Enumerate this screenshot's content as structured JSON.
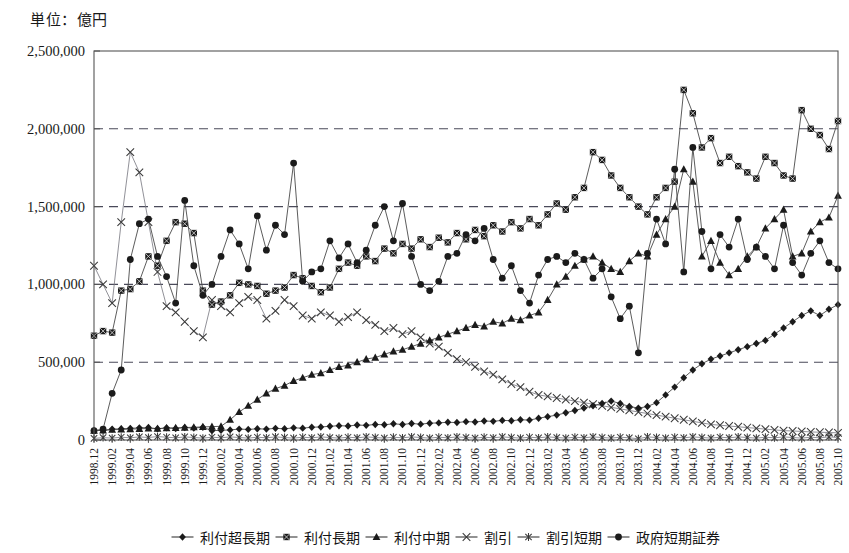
{
  "unit_label": "単位：億円",
  "chart_data": {
    "type": "line",
    "title": "",
    "subtitle": "",
    "xlabel": "",
    "ylabel": "単位：億円",
    "ylim": [
      0,
      2500000
    ],
    "ytick_labels": [
      "0",
      "500,000",
      "1,000,000",
      "1,500,000",
      "2,000,000",
      "2,500,000"
    ],
    "ytick_values": [
      0,
      500000,
      1000000,
      1500000,
      2000000,
      2500000
    ],
    "grid": "horizontal-dashed",
    "legend_position": "bottom",
    "categories": [
      "1998.12",
      "1999.01",
      "1999.02",
      "1999.03",
      "1999.04",
      "1999.05",
      "1999.06",
      "1999.07",
      "1999.08",
      "1999.09",
      "1999.10",
      "1999.11",
      "1999.12",
      "2000.01",
      "2000.02",
      "2000.03",
      "2000.04",
      "2000.05",
      "2000.06",
      "2000.07",
      "2000.08",
      "2000.09",
      "2000.10",
      "2000.11",
      "2000.12",
      "2001.01",
      "2001.02",
      "2001.03",
      "2001.04",
      "2001.05",
      "2001.06",
      "2001.07",
      "2001.08",
      "2001.09",
      "2001.10",
      "2001.11",
      "2001.12",
      "2002.01",
      "2002.02",
      "2002.03",
      "2002.04",
      "2002.05",
      "2002.06",
      "2002.07",
      "2002.08",
      "2002.09",
      "2002.10",
      "2002.11",
      "2002.12",
      "2003.01",
      "2003.02",
      "2003.03",
      "2003.04",
      "2003.05",
      "2003.06",
      "2003.07",
      "2003.08",
      "2003.09",
      "2003.10",
      "2003.11",
      "2003.12",
      "2004.01",
      "2004.02",
      "2004.03",
      "2004.04",
      "2004.05",
      "2004.06",
      "2004.07",
      "2004.08",
      "2004.09",
      "2004.10",
      "2004.11",
      "2004.12",
      "2005.01",
      "2005.02",
      "2005.03",
      "2005.04",
      "2005.05",
      "2005.06",
      "2005.07",
      "2005.08",
      "2005.09",
      "2005.10"
    ],
    "xtick_labels": [
      "1998.12",
      "1999.02",
      "1999.04",
      "1999.06",
      "1999.08",
      "1999.10",
      "1999.12",
      "2000.02",
      "2000.04",
      "2000.06",
      "2000.08",
      "2000.10",
      "2000.12",
      "2001.02",
      "2001.04",
      "2001.06",
      "2001.08",
      "2001.10",
      "2001.12",
      "2002.02",
      "2002.04",
      "2002.06",
      "2002.08",
      "2002.10",
      "2002.12",
      "2003.02",
      "2003.04",
      "2003.06",
      "2003.08",
      "2003.10",
      "2003.12",
      "2004.02",
      "2004.04",
      "2004.06",
      "2004.08",
      "2004.10",
      "2004.12",
      "2005.02",
      "2005.04",
      "2005.06",
      "2005.08",
      "2005.10"
    ],
    "series": [
      {
        "name": "利付超長期",
        "marker": "diamond",
        "values": [
          60000,
          62000,
          70000,
          72000,
          75000,
          78000,
          80000,
          72000,
          78000,
          74000,
          80000,
          76000,
          82000,
          60000,
          62000,
          65000,
          70000,
          68000,
          72000,
          70000,
          75000,
          72000,
          78000,
          76000,
          82000,
          84000,
          88000,
          92000,
          90000,
          96000,
          94000,
          100000,
          98000,
          104000,
          100000,
          106000,
          102000,
          108000,
          110000,
          114000,
          112000,
          118000,
          116000,
          122000,
          120000,
          126000,
          124000,
          130000,
          128000,
          140000,
          150000,
          160000,
          175000,
          190000,
          205000,
          220000,
          235000,
          250000,
          235000,
          215000,
          205000,
          215000,
          240000,
          290000,
          340000,
          400000,
          450000,
          490000,
          520000,
          540000,
          560000,
          580000,
          600000,
          620000,
          640000,
          680000,
          720000,
          760000,
          800000,
          830000,
          800000,
          840000,
          870000
        ]
      },
      {
        "name": "利付長期",
        "marker": "square",
        "values": [
          670000,
          700000,
          690000,
          960000,
          970000,
          1020000,
          1180000,
          1120000,
          1280000,
          1400000,
          1390000,
          1330000,
          960000,
          870000,
          890000,
          930000,
          1010000,
          1000000,
          990000,
          940000,
          960000,
          980000,
          1060000,
          1040000,
          990000,
          950000,
          980000,
          1100000,
          1140000,
          1120000,
          1180000,
          1150000,
          1230000,
          1200000,
          1260000,
          1230000,
          1290000,
          1240000,
          1300000,
          1270000,
          1330000,
          1290000,
          1350000,
          1310000,
          1380000,
          1340000,
          1400000,
          1360000,
          1420000,
          1380000,
          1450000,
          1520000,
          1480000,
          1560000,
          1620000,
          1850000,
          1800000,
          1700000,
          1620000,
          1560000,
          1500000,
          1450000,
          1560000,
          1620000,
          1660000,
          2250000,
          2100000,
          1880000,
          1940000,
          1780000,
          1820000,
          1760000,
          1720000,
          1680000,
          1820000,
          1780000,
          1700000,
          1680000,
          2120000,
          2000000,
          1960000,
          1870000,
          2050000
        ]
      },
      {
        "name": "利付中期",
        "marker": "triangle",
        "values": [
          60000,
          62000,
          66000,
          68000,
          70000,
          72000,
          74000,
          73000,
          76000,
          78000,
          80000,
          82000,
          84000,
          86000,
          88000,
          130000,
          180000,
          220000,
          260000,
          300000,
          330000,
          350000,
          380000,
          400000,
          420000,
          430000,
          450000,
          470000,
          480000,
          500000,
          520000,
          530000,
          550000,
          570000,
          580000,
          600000,
          620000,
          640000,
          660000,
          680000,
          700000,
          720000,
          740000,
          730000,
          760000,
          750000,
          780000,
          770000,
          800000,
          820000,
          900000,
          1000000,
          1050000,
          1120000,
          1160000,
          1180000,
          1140000,
          1100000,
          1080000,
          1150000,
          1200000,
          1180000,
          1320000,
          1420000,
          1500000,
          1740000,
          1660000,
          1180000,
          1280000,
          1140000,
          1060000,
          1100000,
          1180000,
          1240000,
          1360000,
          1420000,
          1480000,
          1180000,
          1200000,
          1340000,
          1400000,
          1430000,
          1570000
        ]
      },
      {
        "name": "割引",
        "marker": "x",
        "values": [
          1120000,
          1000000,
          880000,
          1400000,
          1850000,
          1720000,
          1400000,
          1080000,
          860000,
          820000,
          760000,
          700000,
          660000,
          900000,
          860000,
          820000,
          880000,
          920000,
          900000,
          780000,
          830000,
          900000,
          860000,
          800000,
          780000,
          820000,
          800000,
          760000,
          790000,
          820000,
          770000,
          740000,
          700000,
          720000,
          680000,
          700000,
          660000,
          620000,
          600000,
          560000,
          520000,
          500000,
          470000,
          440000,
          420000,
          390000,
          360000,
          340000,
          310000,
          290000,
          280000,
          270000,
          260000,
          250000,
          240000,
          230000,
          220000,
          210000,
          200000,
          190000,
          180000,
          170000,
          160000,
          150000,
          140000,
          130000,
          120000,
          110000,
          100000,
          95000,
          90000,
          85000,
          80000,
          75000,
          70000,
          65000,
          60000,
          58000,
          55000,
          52000,
          50000,
          48000,
          46000
        ]
      },
      {
        "name": "割引短期",
        "marker": "asterisk",
        "values": [
          10000,
          15000,
          12000,
          18000,
          14000,
          20000,
          16000,
          22000,
          18000,
          14000,
          20000,
          16000,
          12000,
          18000,
          14000,
          20000,
          16000,
          12000,
          18000,
          14000,
          20000,
          16000,
          12000,
          18000,
          14000,
          20000,
          16000,
          12000,
          18000,
          14000,
          20000,
          16000,
          12000,
          18000,
          14000,
          20000,
          16000,
          12000,
          18000,
          14000,
          20000,
          16000,
          12000,
          18000,
          14000,
          20000,
          16000,
          12000,
          18000,
          14000,
          20000,
          16000,
          12000,
          18000,
          14000,
          20000,
          16000,
          12000,
          18000,
          14000,
          8000,
          20000,
          16000,
          12000,
          18000,
          14000,
          20000,
          16000,
          12000,
          18000,
          14000,
          20000,
          16000,
          12000,
          18000,
          14000,
          20000,
          16000,
          12000,
          18000,
          14000,
          20000,
          16000
        ]
      },
      {
        "name": "政府短期証券",
        "marker": "circle",
        "values": [
          60000,
          70000,
          300000,
          450000,
          1160000,
          1390000,
          1420000,
          1180000,
          1050000,
          880000,
          1540000,
          1120000,
          930000,
          1000000,
          1180000,
          1350000,
          1260000,
          1100000,
          1440000,
          1220000,
          1380000,
          1320000,
          1780000,
          1020000,
          1080000,
          1100000,
          1280000,
          1170000,
          1260000,
          1140000,
          1220000,
          1380000,
          1500000,
          1280000,
          1520000,
          1180000,
          1000000,
          960000,
          1020000,
          1180000,
          1200000,
          1320000,
          1280000,
          1360000,
          1160000,
          1040000,
          1120000,
          960000,
          880000,
          1060000,
          1160000,
          1180000,
          1140000,
          1200000,
          1160000,
          1040000,
          1100000,
          920000,
          780000,
          860000,
          560000,
          1200000,
          1420000,
          1260000,
          1740000,
          1080000,
          1880000,
          1340000,
          1100000,
          1320000,
          1240000,
          1420000,
          1160000,
          1240000,
          1180000,
          1100000,
          1380000,
          1140000,
          1060000,
          1200000,
          1280000,
          1140000,
          1100000
        ]
      }
    ]
  },
  "legend": [
    {
      "label": "利付超長期",
      "marker": "diamond"
    },
    {
      "label": "利付長期",
      "marker": "square"
    },
    {
      "label": "利付中期",
      "marker": "triangle"
    },
    {
      "label": "割引",
      "marker": "x"
    },
    {
      "label": "割引短期",
      "marker": "asterisk"
    },
    {
      "label": "政府短期証券",
      "marker": "circle"
    }
  ]
}
